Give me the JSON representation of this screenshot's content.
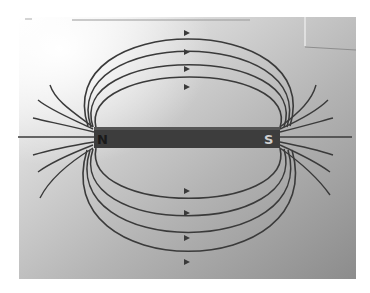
{
  "figure": {
    "magnet": {
      "north_label": "N",
      "south_label": "S"
    },
    "colors": {
      "line": "#3a3a3a",
      "magnet": "#3b3b3b",
      "paper_light": "#f2f2f2",
      "paper_dark": "#8a8a8a"
    },
    "field_line_loops_above": 4,
    "field_line_loops_below": 4,
    "arrow_direction": "N to S (left to right)"
  }
}
